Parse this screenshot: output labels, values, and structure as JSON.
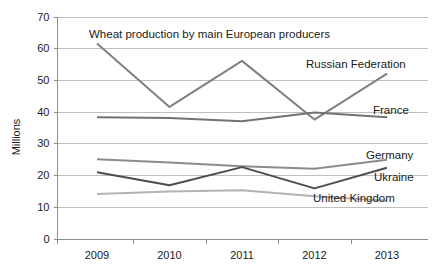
{
  "chart_data": {
    "type": "line",
    "title": "Wheat production by main European producers",
    "xlabel": "",
    "ylabel": "Millions",
    "categories": [
      "2009",
      "2010",
      "2011",
      "2012",
      "2013"
    ],
    "x": [
      2009,
      2010,
      2011,
      2012,
      2013
    ],
    "ylim": [
      0,
      70
    ],
    "yticks": [
      "0",
      "10",
      "20",
      "30",
      "40",
      "50",
      "60",
      "70"
    ],
    "ytick_values": [
      0,
      10,
      20,
      30,
      40,
      50,
      60,
      70
    ],
    "grid": true,
    "legend_position": "inline-right",
    "series": [
      {
        "name": "Russian Federation",
        "values": [
          61.5,
          41.5,
          56.0,
          37.5,
          52.0
        ],
        "color": "#808080",
        "label": "Russian Federation"
      },
      {
        "name": "France",
        "values": [
          38.2,
          38.0,
          37.0,
          39.7,
          38.2
        ],
        "color": "#737373",
        "label": "France"
      },
      {
        "name": "Germany",
        "values": [
          25.0,
          24.0,
          22.8,
          22.0,
          24.8
        ],
        "color": "#8c8c8c",
        "label": "Germany"
      },
      {
        "name": "Ukraine",
        "values": [
          20.9,
          16.8,
          22.5,
          15.8,
          22.3
        ],
        "color": "#4d4d4d",
        "label": "Ukraine"
      },
      {
        "name": "United Kingdom",
        "values": [
          14.0,
          14.8,
          15.2,
          13.3,
          11.9
        ],
        "color": "#b3b3b3",
        "label": "United Kingdom"
      }
    ]
  },
  "axis": {
    "y_title": "Millions"
  },
  "colors": {
    "grid": "#bfbfbf",
    "axis": "#8c8c8c",
    "text": "#1a1a1a",
    "background": "#ffffff"
  }
}
